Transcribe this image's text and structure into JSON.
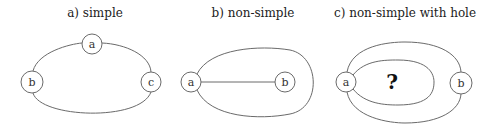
{
  "figure": {
    "panels": [
      {
        "id": "a",
        "title": "a) simple",
        "nodes": [
          {
            "label": "a",
            "x": 92,
            "y": 44
          },
          {
            "label": "b",
            "x": 32,
            "y": 82
          },
          {
            "label": "c",
            "x": 151,
            "y": 82
          }
        ],
        "edges": [
          "a-c (upper arc)",
          "b-a (upper arc)",
          "b-c (lower arc)"
        ]
      },
      {
        "id": "b",
        "title": "b) non-simple",
        "nodes": [
          {
            "label": "a",
            "x": 191,
            "y": 82
          },
          {
            "label": "b",
            "x": 285,
            "y": 82
          }
        ],
        "edges": [
          "a-b (straight)",
          "a-a (loop enclosing b)"
        ]
      },
      {
        "id": "c",
        "title": "c) non-simple with hole",
        "nodes": [
          {
            "label": "a",
            "x": 346,
            "y": 82
          },
          {
            "label": "b",
            "x": 461,
            "y": 83
          }
        ],
        "edges": [
          "a-b (upper arc)",
          "a-b (lower arc)",
          "a-a (inner loop)"
        ],
        "hole_label": "?"
      }
    ]
  }
}
